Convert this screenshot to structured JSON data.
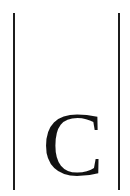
{
  "page": {
    "width": 130,
    "height": 196,
    "background_color": "#ffffff"
  },
  "rules": {
    "color": "#1c1c1c",
    "left": {
      "name": "left-vertical-rule",
      "x": 13,
      "y_top": 13,
      "y_bottom": 190,
      "thickness": 2
    },
    "right": {
      "name": "right-vertical-rule",
      "x": 118,
      "y_top": 13,
      "y_bottom": 190,
      "thickness": 2
    }
  },
  "content": {
    "letter": "C",
    "color": "#111111",
    "typeface_style": "serif",
    "font_size_px": 92,
    "bounds": {
      "left": 45,
      "right": 100,
      "top": 112,
      "bottom": 177
    }
  }
}
